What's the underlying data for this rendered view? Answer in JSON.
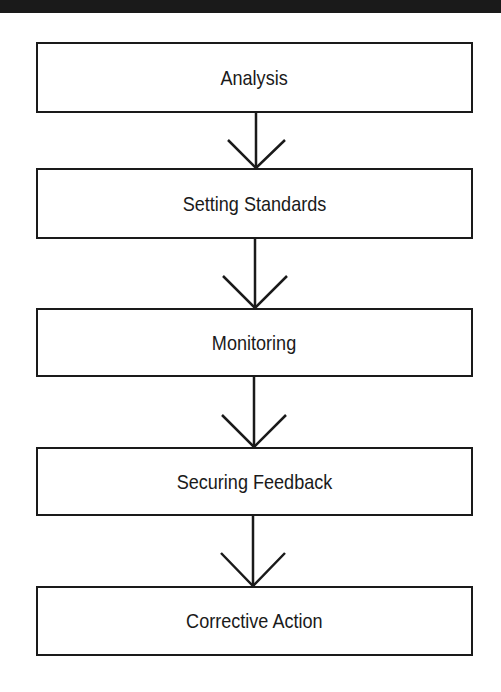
{
  "diagram": {
    "type": "flowchart",
    "direction": "top-to-bottom",
    "colors": {
      "line": "#1a1a1a",
      "background": "#ffffff",
      "top_bar": "#1a1a1a"
    },
    "steps": [
      {
        "label": "Analysis"
      },
      {
        "label": "Setting Standards"
      },
      {
        "label": "Monitoring"
      },
      {
        "label": "Securing Feedback"
      },
      {
        "label": "Corrective Action"
      }
    ],
    "connectors": [
      {
        "from": "Analysis",
        "to": "Setting Standards",
        "style": "open-arrow"
      },
      {
        "from": "Setting Standards",
        "to": "Monitoring",
        "style": "open-arrow"
      },
      {
        "from": "Monitoring",
        "to": "Securing Feedback",
        "style": "open-arrow"
      },
      {
        "from": "Securing Feedback",
        "to": "Corrective Action",
        "style": "open-arrow"
      }
    ]
  }
}
